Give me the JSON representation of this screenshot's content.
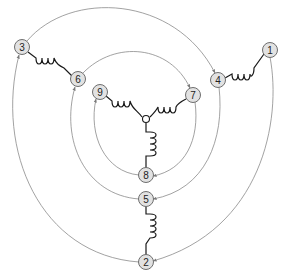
{
  "diagram": {
    "type": "three-phase winding connection diagram",
    "colors": {
      "background": "#ffffff",
      "node_fill": "#e2e2e2",
      "node_stroke": "#6e6e6e",
      "coil_stroke": "#1a1a1a",
      "arc_stroke": "#8a8a8a",
      "label": "#222222"
    },
    "center": {
      "x": 146,
      "y": 119,
      "label": ""
    },
    "nodes": [
      {
        "id": "1",
        "label": "1",
        "x": 270,
        "y": 50
      },
      {
        "id": "2",
        "label": "2",
        "x": 146,
        "y": 262
      },
      {
        "id": "3",
        "label": "3",
        "x": 22,
        "y": 47
      },
      {
        "id": "4",
        "label": "4",
        "x": 218,
        "y": 80
      },
      {
        "id": "5",
        "label": "5",
        "x": 146,
        "y": 199
      },
      {
        "id": "6",
        "label": "6",
        "x": 78,
        "y": 79
      },
      {
        "id": "7",
        "label": "7",
        "x": 193,
        "y": 95
      },
      {
        "id": "8",
        "label": "8",
        "x": 146,
        "y": 175
      },
      {
        "id": "9",
        "label": "9",
        "x": 100,
        "y": 92
      }
    ],
    "coils": [
      {
        "from": "4",
        "to": "1"
      },
      {
        "from": "3",
        "to": "6"
      },
      {
        "from": "9",
        "to": "center"
      },
      {
        "from": "center",
        "to": "7"
      },
      {
        "from": "center",
        "to": "8"
      },
      {
        "from": "5",
        "to": "2"
      }
    ],
    "arcs": [
      {
        "from": "1",
        "to": "2",
        "ring": "outer"
      },
      {
        "from": "2",
        "to": "3",
        "ring": "outer"
      },
      {
        "from": "3",
        "to": "4",
        "ring": "outer"
      },
      {
        "from": "4",
        "to": "5",
        "ring": "middle"
      },
      {
        "from": "5",
        "to": "6",
        "ring": "middle"
      },
      {
        "from": "6",
        "to": "7",
        "ring": "middle"
      },
      {
        "from": "7",
        "to": "8",
        "ring": "inner"
      },
      {
        "from": "8",
        "to": "9",
        "ring": "inner"
      }
    ]
  }
}
